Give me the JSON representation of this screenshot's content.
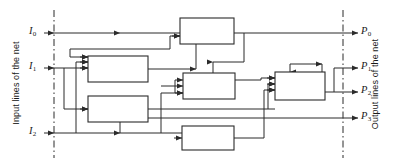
{
  "figure": {
    "kind": "block-diagram",
    "title": "",
    "background_color": "#ffffff",
    "line_color": "#2b2b2b",
    "box_fill": "#ffffff"
  },
  "left_axis": {
    "label": "Input lines of the net",
    "boundary_style": "dash-dot",
    "boundary_x": 54
  },
  "right_axis": {
    "label": "Output lines of the net",
    "boundary_style": "dash-dot",
    "boundary_x": 343
  },
  "inputs": [
    {
      "id": "I0",
      "label": "I",
      "sub": "0",
      "y": 33
    },
    {
      "id": "I1",
      "label": "I",
      "sub": "1",
      "y": 68
    },
    {
      "id": "I2",
      "label": "I",
      "sub": "2",
      "y": 133
    }
  ],
  "outputs": [
    {
      "id": "P0",
      "label": "P",
      "sub": "0",
      "y": 33
    },
    {
      "id": "P1",
      "label": "P",
      "sub": "1",
      "y": 68
    },
    {
      "id": "P2",
      "label": "P",
      "sub": "2",
      "y": 92
    },
    {
      "id": "P3",
      "label": "P",
      "sub": "3",
      "y": 118
    }
  ],
  "blocks": [
    {
      "id": "block-top",
      "label": "",
      "x": 180,
      "y": 18,
      "w": 54,
      "h": 26
    },
    {
      "id": "block-upper-left",
      "label": "",
      "x": 88,
      "y": 56,
      "w": 60,
      "h": 26
    },
    {
      "id": "block-lower-left",
      "label": "",
      "x": 88,
      "y": 96,
      "w": 60,
      "h": 26
    },
    {
      "id": "block-middle-right",
      "label": "",
      "x": 183,
      "y": 73,
      "w": 52,
      "h": 26
    },
    {
      "id": "block-bottom",
      "label": "",
      "x": 182,
      "y": 126,
      "w": 52,
      "h": 24
    },
    {
      "id": "block-right",
      "label": "",
      "x": 275,
      "y": 72,
      "w": 50,
      "h": 28
    }
  ]
}
